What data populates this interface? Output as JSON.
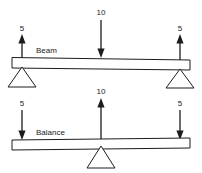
{
  "figure": {
    "background": "#ffffff",
    "ink_color": "#1c1c1c",
    "panels": [
      {
        "id": "beam",
        "name": "Beam",
        "label": "Beam",
        "center_force": {
          "value": "10",
          "direction": "down",
          "role": "applied-load"
        },
        "end_forces": [
          {
            "value": "5",
            "direction": "up",
            "side": "left",
            "role": "support-reaction"
          },
          {
            "value": "5",
            "direction": "up",
            "side": "right",
            "role": "support-reaction"
          }
        ],
        "supports": [
          {
            "side": "left",
            "type": "triangle-pivot"
          },
          {
            "side": "right",
            "type": "triangle-pivot"
          }
        ]
      },
      {
        "id": "balance",
        "name": "Balance",
        "label": "Balance",
        "center_force": {
          "value": "10",
          "direction": "up",
          "role": "fulcrum-reaction"
        },
        "end_forces": [
          {
            "value": "5",
            "direction": "down",
            "side": "left",
            "role": "applied-load"
          },
          {
            "value": "5",
            "direction": "down",
            "side": "right",
            "role": "applied-load"
          }
        ],
        "supports": [
          {
            "side": "center",
            "type": "triangle-pivot"
          }
        ]
      }
    ]
  }
}
